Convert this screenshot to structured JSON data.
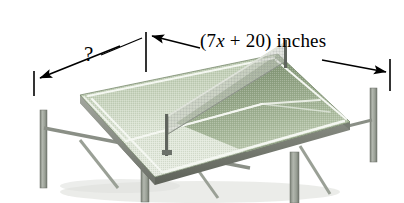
{
  "figure": {
    "kind": "perspective-illustration",
    "background_color": "#ffffff"
  },
  "labels": {
    "width": {
      "prefix": "(7",
      "variable": "x",
      "suffix": " + 20) inches",
      "full_text": "(7x + 20) inches"
    },
    "unknown_depth": {
      "text": "?"
    }
  },
  "colors": {
    "table_top_light": "#e9eee3",
    "table_top_mid": "#c6d2bb",
    "table_top_dark": "#8fa383",
    "table_top_far": "#758a68",
    "table_edge_band": "#8d9189",
    "table_edge_band_dark": "#6d7169",
    "leg_gray": "#9aa098",
    "leg_gray_dark": "#777d75",
    "net_gray": "#b9bdb6",
    "net_post": "#5f645d",
    "line_white": "#f4f7f1",
    "annotation_black": "#000000",
    "shadow_gray": "#d8dad6"
  },
  "annotations": [
    {
      "name": "left-tick",
      "type": "tick-mark",
      "x": 34,
      "y_top": 71,
      "y_bottom": 96
    },
    {
      "name": "center-tick",
      "type": "tick-mark",
      "x": 146,
      "y_top": 32,
      "y_bottom": 72
    },
    {
      "name": "right-tick",
      "type": "tick-mark",
      "x": 390,
      "y_top": 59,
      "y_bottom": 91
    },
    {
      "name": "depth-arrow",
      "type": "arrow",
      "from_x": 120,
      "from_y": 46,
      "to_x": 38,
      "to_y": 78
    },
    {
      "name": "unknown-leader",
      "type": "leader-line",
      "from_x": 101,
      "from_y": 54,
      "to_x": 143,
      "to_y": 37
    },
    {
      "name": "width-arrow-left",
      "type": "arrow",
      "from_x": 200,
      "from_y": 48,
      "to_x": 150,
      "to_y": 36
    },
    {
      "name": "width-arrow-right",
      "type": "arrow",
      "from_x": 322,
      "from_y": 60,
      "to_x": 387,
      "to_y": 72
    }
  ],
  "table_geometry": {
    "description": "Table tennis table in three-quarter perspective, net dividing it diagonally",
    "top_surface": {
      "back_left": [
        80,
        103
      ],
      "back_right": [
        278,
        62
      ],
      "front_right": [
        350,
        130
      ],
      "front_left": [
        155,
        185
      ]
    },
    "center_line_visible": true,
    "net_visible": true,
    "leg_count": 4
  }
}
